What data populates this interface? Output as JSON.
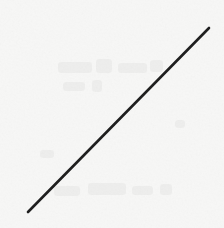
{
  "figure": {
    "kind": "scanned-line-drawing",
    "background_color": "#f7f7f6",
    "ink_color": "#1c1c1c",
    "width": 224,
    "height": 228,
    "title": "",
    "caption": ""
  },
  "chart_data": {
    "type": "line",
    "title": "",
    "subtitle": "",
    "xlabel": "",
    "ylabel": "",
    "xlim": [
      0,
      1
    ],
    "ylim": [
      0,
      1
    ],
    "xticks": [],
    "yticks": [],
    "xticklabels": [],
    "yticklabels": [],
    "grid": false,
    "legend": false,
    "legend_position": "none",
    "annotations": [],
    "series": [
      {
        "name": "",
        "x": [
          0,
          1
        ],
        "y": [
          0,
          1
        ],
        "style": "solid",
        "color": "#1c1c1c",
        "width_px": 2.6,
        "marker": "none"
      }
    ]
  },
  "geometry": {
    "y_axis": {
      "x": 25.5,
      "y_top": 26,
      "y_bottom": 216,
      "stroke": 2.2,
      "color": "#1c1c1c"
    },
    "x_axis": {
      "y": 215.2,
      "x_left": 25,
      "x_right": 213,
      "stroke": 2.0,
      "color": "#22221f"
    },
    "diagonal": {
      "x1": 28,
      "y1": 212,
      "x2": 209,
      "y2": 28,
      "stroke": 2.6,
      "color": "#17170f"
    }
  }
}
